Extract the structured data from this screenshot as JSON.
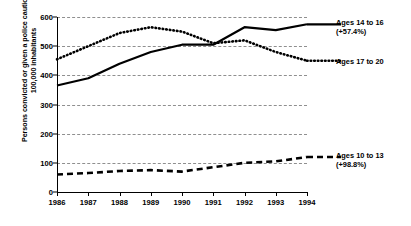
{
  "chart_data": {
    "type": "line",
    "title": "",
    "subtitle": "",
    "xlabel": "",
    "ylabel": "Persons convicted or given a police caution, per 100,000 inhabitants",
    "categories": [
      "1986",
      "1987",
      "1988",
      "1989",
      "1990",
      "1991",
      "1992",
      "1993",
      "1994"
    ],
    "x": [
      1986,
      1987,
      1988,
      1989,
      1990,
      1991,
      1992,
      1993,
      1994
    ],
    "xlim": [
      1986,
      1994
    ],
    "ylim": [
      0,
      600
    ],
    "yticks": [
      0,
      100,
      200,
      300,
      400,
      500,
      600
    ],
    "ytick_labels": [
      "0",
      "100",
      "200",
      "300",
      "400",
      "500",
      "600"
    ],
    "grid": true,
    "legend_position": "right-inline-annotations",
    "series": [
      {
        "name": "Ages 14 to 16",
        "change_label": "(+57.4%)",
        "style": "solid",
        "color": "#000000",
        "values": [
          365,
          390,
          440,
          480,
          505,
          505,
          565,
          555,
          575
        ]
      },
      {
        "name": "Ages 17 to 20",
        "change_label": "",
        "style": "dotted",
        "color": "#000000",
        "values": [
          455,
          500,
          545,
          565,
          550,
          510,
          520,
          480,
          450
        ]
      },
      {
        "name": "Ages 10 to 13",
        "change_label": "(+98.8%)",
        "style": "dashed",
        "color": "#000000",
        "values": [
          60,
          65,
          72,
          75,
          70,
          85,
          100,
          105,
          120
        ]
      }
    ],
    "annotations": [
      {
        "id": "ages-14-16",
        "line1": "Ages 14 to 16",
        "line2": "(+57.4%)"
      },
      {
        "id": "ages-17-20",
        "line1": "Ages 17 to 20",
        "line2": ""
      },
      {
        "id": "ages-10-13",
        "line1": "Ages 10 to 13",
        "line2": "(+98.8%)"
      }
    ]
  }
}
